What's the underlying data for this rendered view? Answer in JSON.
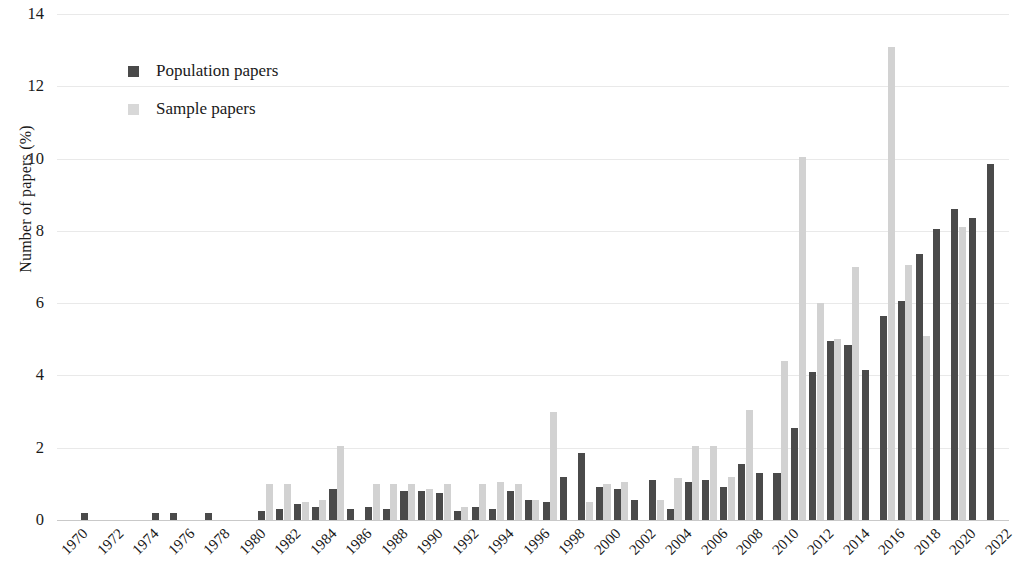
{
  "chart_data": {
    "type": "bar",
    "title": "",
    "xlabel": "",
    "ylabel": "Number of papers (%)",
    "ylim": [
      0,
      14
    ],
    "ytick_step": 2,
    "yticks": [
      0,
      2,
      4,
      6,
      8,
      10,
      12,
      14
    ],
    "grid": "horizontal",
    "legend_position": "top-left",
    "xtick_labels": [
      "1970",
      "1972",
      "1974",
      "1976",
      "1978",
      "1980",
      "1982",
      "1984",
      "1986",
      "1988",
      "1990",
      "1992",
      "1994",
      "1996",
      "1998",
      "2000",
      "2002",
      "2004",
      "2006",
      "2008",
      "2010",
      "2012",
      "2014",
      "2016",
      "2018",
      "2020",
      "2022"
    ],
    "xtick_years": [
      1970,
      1972,
      1974,
      1976,
      1978,
      1980,
      1982,
      1984,
      1986,
      1988,
      1990,
      1992,
      1994,
      1996,
      1998,
      2000,
      2002,
      2004,
      2006,
      2008,
      2010,
      2012,
      2014,
      2016,
      2018,
      2020,
      2022
    ],
    "x": [
      1970,
      1971,
      1972,
      1973,
      1974,
      1975,
      1976,
      1977,
      1978,
      1979,
      1980,
      1981,
      1982,
      1983,
      1984,
      1985,
      1986,
      1987,
      1988,
      1989,
      1990,
      1991,
      1992,
      1993,
      1994,
      1995,
      1996,
      1997,
      1998,
      1999,
      2000,
      2001,
      2002,
      2003,
      2004,
      2005,
      2006,
      2007,
      2008,
      2009,
      2010,
      2011,
      2012,
      2013,
      2014,
      2015,
      2016,
      2017,
      2018,
      2019,
      2020,
      2021,
      2022
    ],
    "series": [
      {
        "name": "Population papers",
        "color": "#4a4a4a",
        "values": [
          0,
          0.2,
          0,
          0,
          0,
          0.2,
          0.2,
          0,
          0.2,
          0,
          0,
          0.25,
          0.3,
          0.45,
          0.35,
          0.85,
          0.3,
          0.35,
          0.3,
          0.8,
          0.8,
          0.75,
          0.25,
          0.35,
          0.3,
          0.8,
          0.55,
          0.5,
          1.2,
          1.85,
          0.9,
          0.85,
          0.55,
          1.1,
          0.3,
          1.05,
          1.1,
          0.9,
          1.55,
          1.3,
          1.3,
          2.55,
          4.1,
          4.95,
          4.85,
          4.15,
          5.65,
          6.05,
          7.35,
          8.05,
          8.6,
          8.35,
          9.85
        ]
      },
      {
        "name": "Sample papers",
        "color": "#d2d2d2",
        "values": [
          0,
          0,
          0,
          0,
          0,
          0,
          0,
          0,
          0,
          0,
          0,
          1.0,
          1.0,
          0.5,
          0.55,
          2.05,
          0,
          1.0,
          1.0,
          1.0,
          0.85,
          1.0,
          0.35,
          1.0,
          1.05,
          1.0,
          0.55,
          3.0,
          0,
          0.5,
          1.0,
          1.05,
          0,
          0.55,
          1.15,
          2.05,
          2.05,
          1.2,
          3.05,
          0,
          4.4,
          10.05,
          6.0,
          5.0,
          7.0,
          0,
          13.1,
          7.05,
          5.1,
          0,
          8.1,
          0,
          0
        ]
      }
    ]
  },
  "legend": {
    "items": [
      {
        "label": "Population papers",
        "swatch": "pop"
      },
      {
        "label": "Sample papers",
        "swatch": "samp"
      }
    ]
  },
  "axes": {
    "y_title": "Number of papers (%)"
  }
}
